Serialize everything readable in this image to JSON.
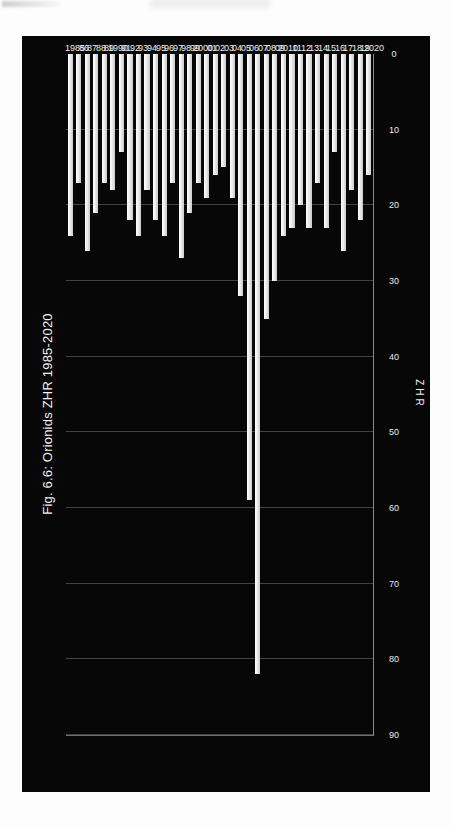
{
  "figure": {
    "title": "Fig. 6.6: Orionids ZHR 1985-2020",
    "plate_background": "#070707",
    "bar_color": "#f0f0f0",
    "text_color": "#ededed",
    "gridline_color": "#969696"
  },
  "chart_data": {
    "type": "bar",
    "orientation": "horizontal",
    "title": "Fig. 6.6: Orionids ZHR 1985-2020",
    "xlabel": "Year",
    "ylabel": "ZHR",
    "ylim": [
      0,
      90
    ],
    "yticks": [
      0,
      10,
      20,
      30,
      40,
      50,
      60,
      70,
      80,
      90
    ],
    "grid": true,
    "legend": null,
    "categories": [
      "1985",
      "86",
      "87",
      "88",
      "89",
      "1990",
      "91",
      "92",
      "93",
      "94",
      "95",
      "96",
      "97",
      "98",
      "99",
      "2000",
      "01",
      "02",
      "03",
      "04",
      "05",
      "06",
      "07",
      "08",
      "09",
      "2010",
      "11",
      "12",
      "13",
      "14",
      "15",
      "16",
      "17",
      "18",
      "19",
      "2020"
    ],
    "tick_labels_year": [
      "1985",
      "86",
      "87",
      "88",
      "89",
      "1990",
      "91",
      "92",
      "93",
      "94",
      "95",
      "96",
      "97",
      "98",
      "99",
      "2000",
      "01",
      "02",
      "03",
      "04",
      "05",
      "06",
      "07",
      "08",
      "09",
      "2010",
      "11",
      "12",
      "13",
      "14",
      "15",
      "16",
      "17",
      "18",
      "19",
      "2020"
    ],
    "values": [
      24,
      17,
      26,
      21,
      17,
      18,
      13,
      22,
      24,
      18,
      22,
      24,
      17,
      27,
      21,
      17,
      19,
      16,
      15,
      19,
      32,
      59,
      82,
      35,
      30,
      24,
      23,
      20,
      23,
      17,
      23,
      13,
      26,
      18,
      22,
      16
    ]
  }
}
